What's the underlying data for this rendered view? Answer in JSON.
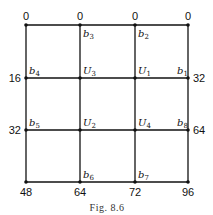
{
  "figure": {
    "caption": "Fig. 8.6",
    "grid": {
      "columns_x": [
        26,
        80,
        135,
        188
      ],
      "rows_y": [
        25,
        78,
        130,
        182
      ]
    },
    "boundary_values": {
      "top": [
        "0",
        "0",
        "0",
        "0"
      ],
      "left_row1": "16",
      "left_row2": "32",
      "right_row1": "32",
      "right_row2": "64",
      "bottom": [
        "48",
        "64",
        "72",
        "96"
      ]
    },
    "node_labels": {
      "b1": {
        "base": "b",
        "sub": "1"
      },
      "b2": {
        "base": "b",
        "sub": "2"
      },
      "b3": {
        "base": "b",
        "sub": "3"
      },
      "b4": {
        "base": "b",
        "sub": "4"
      },
      "b5": {
        "base": "b",
        "sub": "5"
      },
      "b6": {
        "base": "b",
        "sub": "6"
      },
      "b7": {
        "base": "b",
        "sub": "7"
      },
      "b8": {
        "base": "b",
        "sub": "8"
      },
      "U1": {
        "base": "U",
        "sub": "1"
      },
      "U2": {
        "base": "U",
        "sub": "2"
      },
      "U3": {
        "base": "U",
        "sub": "3"
      },
      "U4": {
        "base": "U",
        "sub": "4"
      }
    }
  }
}
